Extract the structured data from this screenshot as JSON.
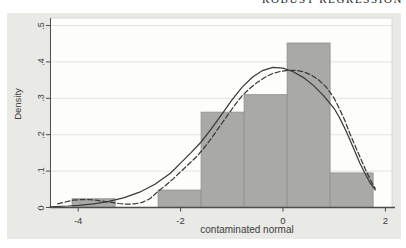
{
  "page": {
    "header_text": "ROBUST REGRESSION"
  },
  "colors": {
    "figure_bg": "#e9e9e5",
    "plot_bg": "#fdfdfb",
    "bar_fill": "#a9a9a7",
    "bar_stroke": "#8f8f8d",
    "axis": "#4c4c4a",
    "grid": "#e3e3de",
    "frame": "#d8d8d3",
    "text": "#3d3d3b",
    "curve": "#3a3a38",
    "header_text": "#1e1e1e"
  },
  "chart_data": {
    "type": "bar",
    "subtype": "histogram-with-density-curves",
    "title": "",
    "xlabel": "contaminated normal",
    "ylabel": "Density",
    "xlim": [
      -4.55,
      2.13
    ],
    "ylim": [
      0,
      0.52
    ],
    "x_ticks": [
      -4,
      -2,
      0,
      2
    ],
    "x_tick_labels": [
      "-4",
      "-2",
      "0",
      "2"
    ],
    "y_ticks": [
      0,
      0.1,
      0.2,
      0.3,
      0.4,
      0.5
    ],
    "y_tick_labels": [
      "0",
      ".1",
      ".2",
      ".3",
      ".4",
      ".5"
    ],
    "grid": true,
    "histogram": {
      "bin_width": 0.84,
      "bins": [
        {
          "x0": -4.12,
          "x1": -3.28,
          "density": 0.024
        },
        {
          "x0": -3.28,
          "x1": -2.44,
          "density": 0.0
        },
        {
          "x0": -2.44,
          "x1": -1.6,
          "density": 0.048
        },
        {
          "x0": -1.6,
          "x1": -0.76,
          "density": 0.262
        },
        {
          "x0": -0.76,
          "x1": 0.08,
          "density": 0.31
        },
        {
          "x0": 0.08,
          "x1": 0.92,
          "density": 0.452
        },
        {
          "x0": 0.92,
          "x1": 1.76,
          "density": 0.095
        }
      ]
    },
    "series": [
      {
        "name": "solid",
        "style": "solid",
        "points": [
          [
            -4.55,
            0.002
          ],
          [
            -4.2,
            0.004
          ],
          [
            -4.0,
            0.006
          ],
          [
            -3.7,
            0.01
          ],
          [
            -3.4,
            0.017
          ],
          [
            -3.1,
            0.027
          ],
          [
            -2.8,
            0.042
          ],
          [
            -2.5,
            0.064
          ],
          [
            -2.2,
            0.094
          ],
          [
            -2.0,
            0.122
          ],
          [
            -1.8,
            0.15
          ],
          [
            -1.6,
            0.18
          ],
          [
            -1.4,
            0.216
          ],
          [
            -1.2,
            0.255
          ],
          [
            -1.0,
            0.295
          ],
          [
            -0.8,
            0.33
          ],
          [
            -0.6,
            0.358
          ],
          [
            -0.4,
            0.376
          ],
          [
            -0.2,
            0.385
          ],
          [
            0.0,
            0.383
          ],
          [
            0.2,
            0.373
          ],
          [
            0.4,
            0.357
          ],
          [
            0.6,
            0.335
          ],
          [
            0.8,
            0.306
          ],
          [
            1.0,
            0.272
          ],
          [
            1.1,
            0.248
          ],
          [
            1.2,
            0.22
          ],
          [
            1.3,
            0.188
          ],
          [
            1.4,
            0.155
          ],
          [
            1.5,
            0.122
          ],
          [
            1.6,
            0.094
          ],
          [
            1.7,
            0.068
          ],
          [
            1.8,
            0.048
          ]
        ]
      },
      {
        "name": "dashed",
        "style": "dashed",
        "points": [
          [
            -4.4,
            0.01
          ],
          [
            -4.25,
            0.015
          ],
          [
            -4.1,
            0.02
          ],
          [
            -3.95,
            0.022
          ],
          [
            -3.8,
            0.022
          ],
          [
            -3.65,
            0.02
          ],
          [
            -3.5,
            0.017
          ],
          [
            -3.35,
            0.014
          ],
          [
            -3.2,
            0.011
          ],
          [
            -3.05,
            0.009
          ],
          [
            -2.9,
            0.01
          ],
          [
            -2.75,
            0.014
          ],
          [
            -2.6,
            0.024
          ],
          [
            -2.45,
            0.043
          ],
          [
            -2.3,
            0.06
          ],
          [
            -2.15,
            0.078
          ],
          [
            -2.0,
            0.098
          ],
          [
            -1.85,
            0.118
          ],
          [
            -1.7,
            0.138
          ],
          [
            -1.55,
            0.162
          ],
          [
            -1.4,
            0.19
          ],
          [
            -1.25,
            0.22
          ],
          [
            -1.1,
            0.25
          ],
          [
            -0.95,
            0.28
          ],
          [
            -0.8,
            0.307
          ],
          [
            -0.65,
            0.327
          ],
          [
            -0.5,
            0.344
          ],
          [
            -0.35,
            0.358
          ],
          [
            -0.2,
            0.368
          ],
          [
            -0.05,
            0.374
          ],
          [
            0.1,
            0.377
          ],
          [
            0.25,
            0.377
          ],
          [
            0.4,
            0.373
          ],
          [
            0.55,
            0.364
          ],
          [
            0.7,
            0.35
          ],
          [
            0.85,
            0.33
          ],
          [
            1.0,
            0.3
          ],
          [
            1.1,
            0.272
          ],
          [
            1.2,
            0.242
          ],
          [
            1.3,
            0.205
          ],
          [
            1.4,
            0.172
          ],
          [
            1.5,
            0.14
          ],
          [
            1.6,
            0.108
          ],
          [
            1.7,
            0.078
          ],
          [
            1.8,
            0.052
          ]
        ]
      }
    ]
  },
  "layout_labels": {
    "y_tick_x": 41,
    "y_title_x": 17,
    "y_title_y": 104,
    "x_tick_y": 220,
    "x_title_x": 247,
    "x_title_y": 229
  }
}
